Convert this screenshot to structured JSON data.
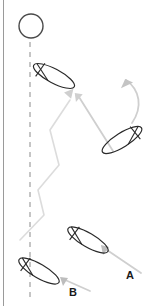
{
  "figure": {
    "width": 157,
    "height": 306,
    "background_color": "#ffffff",
    "border_color": "#9a9a9a"
  },
  "colors": {
    "boat_outline": "#1f1f1f",
    "path_line": "#d8d8d8",
    "arrow": "#c9c9c9",
    "dashed_line": "#8c8c8c",
    "label_text": "#1a1a1a",
    "mark_outline": "#4a4a4a"
  },
  "labels": [
    {
      "id": "label-a",
      "text": "A",
      "x": 130,
      "y": 279
    },
    {
      "id": "label-b",
      "text": "B",
      "x": 73,
      "y": 296
    }
  ],
  "mark": {
    "name": "windward-mark",
    "shape": "circle",
    "cx": 31,
    "cy": 26,
    "r": 12
  },
  "rhumb_line": {
    "name": "rhumb-line",
    "style": "dashed",
    "x": 30,
    "y_start": 42,
    "y_end": 300
  },
  "boats": [
    {
      "id": "boat-top",
      "cx": 54,
      "cy": 76,
      "rotation": 28,
      "length": 46,
      "beam": 14
    },
    {
      "id": "boat-right",
      "cx": 122,
      "cy": 140,
      "rotation": -32,
      "length": 46,
      "beam": 14
    },
    {
      "id": "boat-a",
      "cx": 88,
      "cy": 240,
      "rotation": 30,
      "length": 46,
      "beam": 14
    },
    {
      "id": "boat-b",
      "cx": 39,
      "cy": 271,
      "rotation": 30,
      "length": 46,
      "beam": 14
    }
  ],
  "tack_path": {
    "name": "zigzag-tack-path",
    "points": "20,240 44,215 38,190 59,165 50,130 70,100"
  },
  "arrows": [
    {
      "id": "arrow-a-course",
      "from": [
        140,
        272
      ],
      "to": [
        99,
        244
      ]
    },
    {
      "id": "arrow-b-course",
      "from": [
        89,
        290
      ],
      "to": [
        59,
        276
      ]
    },
    {
      "id": "arrow-right-to-top",
      "from": [
        112,
        150
      ],
      "to": [
        76,
        94
      ]
    },
    {
      "id": "arrow-zigzag-head",
      "to": [
        64,
        92
      ]
    },
    {
      "id": "arrow-curved-wind",
      "path": "M 132,122 C 142,106 140,90 126,81"
    }
  ]
}
